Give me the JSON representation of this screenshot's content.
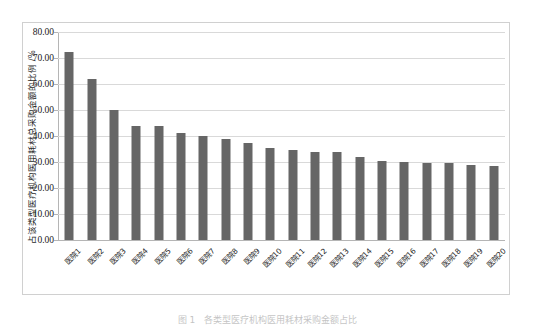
{
  "chart_data": {
    "type": "bar",
    "title": "",
    "xlabel": "",
    "ylabel": "占该类型医疗机构医用耗材总采购金额的比例 /%",
    "ylim": [
      0,
      80
    ],
    "ytick_step": 10,
    "grid": true,
    "legend": "none",
    "bar_color": "#666666",
    "gridline_color": "#d9d9d9",
    "categories": [
      "医院1",
      "医院2",
      "医院3",
      "医院4",
      "医院5",
      "医院6",
      "医院7",
      "医院8",
      "医院9",
      "医院10",
      "医院11",
      "医院12",
      "医院13",
      "医院14",
      "医院15",
      "医院16",
      "医院17",
      "医院18",
      "医院19",
      "医院20"
    ],
    "values": [
      72.5,
      62.0,
      50.0,
      44.0,
      44.0,
      41.0,
      40.0,
      39.0,
      37.5,
      35.5,
      34.5,
      34.0,
      34.0,
      32.0,
      30.5,
      30.0,
      29.5,
      29.5,
      29.0,
      28.5
    ],
    "ytick_labels": [
      "80.00",
      "70.00",
      "60.00",
      "50.00",
      "40.00",
      "30.00",
      "20.00",
      "10.00",
      "0.00"
    ],
    "ytick_values": [
      80,
      70,
      60,
      50,
      40,
      30,
      20,
      10,
      0
    ]
  },
  "caption": {
    "text": "图 1　各类型医疗机构医用耗材采购金额占比"
  }
}
